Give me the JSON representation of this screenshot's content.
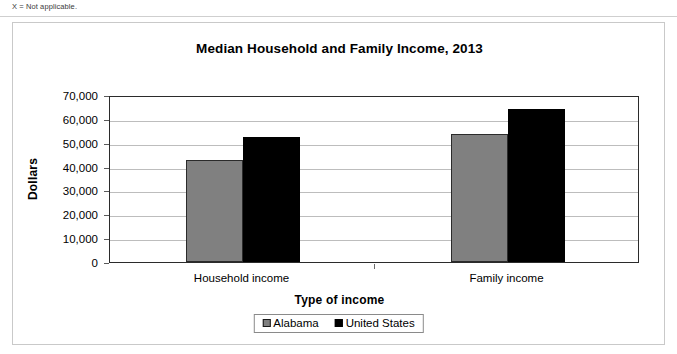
{
  "note": "X = Not applicable.",
  "chart_data": {
    "type": "bar",
    "title": "Median Household and Family Income, 2013",
    "xlabel": "Type of income",
    "ylabel": "Dollars",
    "categories": [
      "Household income",
      "Family income"
    ],
    "series": [
      {
        "name": "Alabama",
        "color": "#808080",
        "values": [
          42800,
          53500
        ]
      },
      {
        "name": "United States",
        "color": "#000000",
        "values": [
          52200,
          64000
        ]
      }
    ],
    "ylim": [
      0,
      70000
    ],
    "ytick_labels": [
      "70,000",
      "60,000",
      "50,000",
      "40,000",
      "30,000",
      "20,000",
      "10,000",
      "0"
    ],
    "ytick_values": [
      70000,
      60000,
      50000,
      40000,
      30000,
      20000,
      10000,
      0
    ],
    "grid": true,
    "legend_position": "bottom"
  }
}
